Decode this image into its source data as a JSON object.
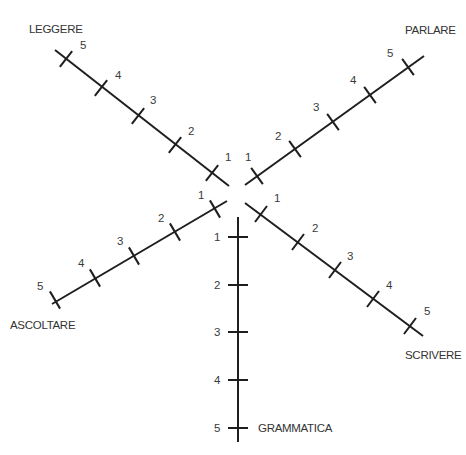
{
  "diagram": {
    "type": "radial-skill-scale",
    "colors": {
      "line": "#1e1e1e",
      "text": "#333333"
    },
    "scale": [
      "1",
      "2",
      "3",
      "4",
      "5"
    ],
    "axes": [
      {
        "id": "leggere",
        "title": "LEGGERE",
        "title_pos": [
          29,
          33
        ],
        "line": [
          [
            55,
            50
          ],
          [
            229,
            186
          ]
        ],
        "ticks": [
          [
            212,
            173
          ],
          [
            175,
            145
          ],
          [
            138,
            116
          ],
          [
            101,
            88
          ],
          [
            66,
            59
          ]
        ],
        "tick_dir": [
          0.62,
          0.79
        ],
        "labels": [
          {
            "text": "1",
            "pos": [
              225,
              161
            ]
          },
          {
            "text": "2",
            "pos": [
              188,
              135
            ]
          },
          {
            "text": "3",
            "pos": [
              150,
              104
            ]
          },
          {
            "text": "4",
            "pos": [
              115,
              79
            ]
          },
          {
            "text": "5",
            "pos": [
              80,
              49
            ]
          }
        ]
      },
      {
        "id": "parlare",
        "title": "PARLARE",
        "title_pos": [
          405,
          34
        ],
        "line": [
          [
            245,
            185
          ],
          [
            424,
            56
          ]
        ],
        "ticks": [
          [
            257,
            176
          ],
          [
            295,
            149
          ],
          [
            333,
            122
          ],
          [
            370,
            95
          ],
          [
            408,
            67
          ]
        ],
        "tick_dir": [
          0.58,
          0.81
        ],
        "labels": [
          {
            "text": "1",
            "pos": [
              245,
              161
            ]
          },
          {
            "text": "2",
            "pos": [
              275,
              140
            ]
          },
          {
            "text": "3",
            "pos": [
              313,
              111
            ]
          },
          {
            "text": "4",
            "pos": [
              350,
              84
            ]
          },
          {
            "text": "5",
            "pos": [
              387,
              57
            ]
          }
        ]
      },
      {
        "id": "ascoltare",
        "title": "ASCOLTARE",
        "title_pos": [
          10,
          329
        ],
        "line": [
          [
            227,
            201
          ],
          [
            52,
            304
          ]
        ],
        "ticks": [
          [
            215,
            209
          ],
          [
            175,
            232
          ],
          [
            134,
            256
          ],
          [
            95,
            278
          ],
          [
            55,
            300
          ]
        ],
        "tick_dir": [
          0.5,
          0.87
        ],
        "labels": [
          {
            "text": "1",
            "pos": [
              198,
              199
            ]
          },
          {
            "text": "2",
            "pos": [
              158,
              222
            ]
          },
          {
            "text": "3",
            "pos": [
              117,
              245
            ]
          },
          {
            "text": "4",
            "pos": [
              78,
              267
            ]
          },
          {
            "text": "5",
            "pos": [
              37,
              290
            ]
          }
        ]
      },
      {
        "id": "scrivere",
        "title": "SCRIVERE",
        "title_pos": [
          405,
          359
        ],
        "line": [
          [
            245,
            203
          ],
          [
            423,
            336
          ]
        ],
        "ticks": [
          [
            261,
            214
          ],
          [
            298,
            242
          ],
          [
            335,
            270
          ],
          [
            373,
            299
          ],
          [
            410,
            326
          ]
        ],
        "tick_dir": [
          0.6,
          -0.8
        ],
        "labels": [
          {
            "text": "1",
            "pos": [
              274,
              202
            ]
          },
          {
            "text": "2",
            "pos": [
              312,
              232
            ]
          },
          {
            "text": "3",
            "pos": [
              347,
              260
            ]
          },
          {
            "text": "4",
            "pos": [
              386,
              289
            ]
          },
          {
            "text": "5",
            "pos": [
              424,
              315
            ]
          }
        ]
      },
      {
        "id": "grammatica",
        "title": "GRAMMATICA",
        "title_pos": [
          258,
          432
        ],
        "line": [
          [
            238,
            217
          ],
          [
            238,
            442
          ]
        ],
        "ticks": [
          [
            238,
            237
          ],
          [
            238,
            285
          ],
          [
            238,
            332
          ],
          [
            238,
            380
          ],
          [
            238,
            428
          ]
        ],
        "tick_dir": [
          1,
          0
        ],
        "labels": [
          {
            "text": "1",
            "pos": [
              214,
              241
            ]
          },
          {
            "text": "2",
            "pos": [
              214,
              289
            ]
          },
          {
            "text": "3",
            "pos": [
              214,
              336
            ]
          },
          {
            "text": "4",
            "pos": [
              214,
              384
            ]
          },
          {
            "text": "5",
            "pos": [
              214,
              432
            ]
          }
        ]
      }
    ]
  }
}
